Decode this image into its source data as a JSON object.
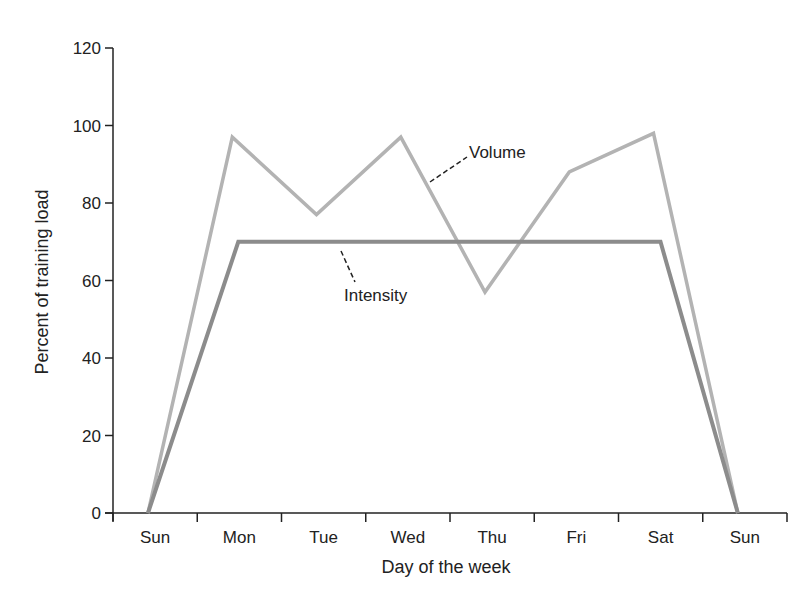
{
  "chart_data": {
    "type": "line",
    "title": "",
    "xlabel": "Day of the week",
    "ylabel": "Percent of training load",
    "categories": [
      "Sun",
      "Mon",
      "Tue",
      "Wed",
      "Thu",
      "Fri",
      "Sat",
      "Sun"
    ],
    "ylim": [
      0,
      120
    ],
    "yticks": [
      0,
      20,
      40,
      60,
      80,
      100,
      120
    ],
    "grid": false,
    "legend": "none (inline annotations)",
    "series": [
      {
        "name": "Volume",
        "color": "#b3b3b3",
        "values": [
          0,
          97,
          77,
          97,
          57,
          88,
          98,
          0
        ]
      },
      {
        "name": "Intensity",
        "color": "#8c8c8c",
        "values": [
          0,
          70,
          70,
          70,
          70,
          70,
          70,
          0
        ]
      }
    ],
    "annotations": [
      {
        "text": "Volume",
        "points_to": "Volume"
      },
      {
        "text": "Intensity",
        "points_to": "Intensity"
      }
    ]
  }
}
